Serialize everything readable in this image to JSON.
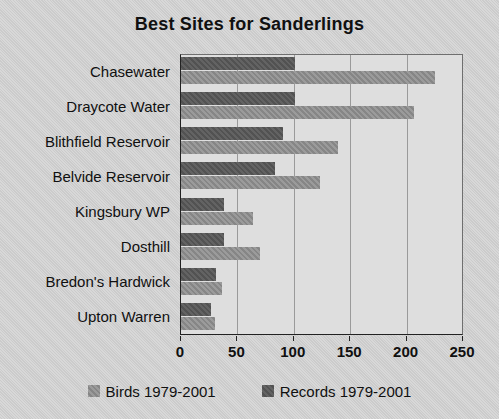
{
  "chart_data": {
    "type": "bar",
    "orientation": "horizontal",
    "title": "Best Sites for Sanderlings",
    "xlabel": "",
    "ylabel": "",
    "xlim": [
      0,
      250
    ],
    "xticks": [
      0,
      50,
      100,
      150,
      200,
      250
    ],
    "grid": true,
    "legend_position": "bottom",
    "categories": [
      "Chasewater",
      "Draycote Water",
      "Blithfield Reservoir",
      "Belvide Reservoir",
      "Kingsbury WP",
      "Dosthill",
      "Bredon's Hardwick",
      "Upton Warren"
    ],
    "series": [
      {
        "name": "Records 1979-2001",
        "color": "#575757",
        "values": [
          101,
          101,
          90,
          83,
          38,
          38,
          31,
          27
        ]
      },
      {
        "name": "Birds 1979-2001",
        "color": "#8d8d8d",
        "values": [
          225,
          207,
          139,
          123,
          64,
          70,
          36,
          30
        ]
      }
    ]
  },
  "legend": {
    "items": [
      {
        "label": "Birds 1979-2001",
        "swatch": "birds-swatch"
      },
      {
        "label": "Records 1979-2001",
        "swatch": "records-swatch"
      }
    ]
  },
  "colors": {
    "background": "#d2d2d2",
    "plot_background": "#dedede",
    "axis": "#222222",
    "gridline": "#9a9a9a",
    "series_records": "#575757",
    "series_birds": "#8d8d8d"
  }
}
